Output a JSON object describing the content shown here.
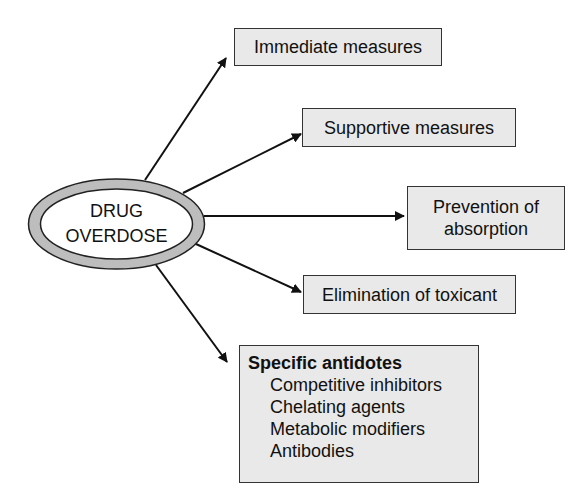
{
  "diagram": {
    "center": {
      "line1": "DRUG",
      "line2": "OVERDOSE"
    },
    "branches": [
      {
        "id": "immediate",
        "label": "Immediate measures"
      },
      {
        "id": "supportive",
        "label": "Supportive measures"
      },
      {
        "id": "prevention",
        "line1": "Prevention of",
        "line2": "absorption"
      },
      {
        "id": "elimination",
        "label": "Elimination of toxicant"
      },
      {
        "id": "antidotes",
        "title": "Specific antidotes",
        "items": [
          "Competitive inhibitors",
          "Chelating agents",
          "Metabolic modifiers",
          "Antibodies"
        ]
      }
    ],
    "colors": {
      "box_fill": "#e9e9e9",
      "ring_fill": "#bdbdbd",
      "stroke": "#111111"
    }
  }
}
